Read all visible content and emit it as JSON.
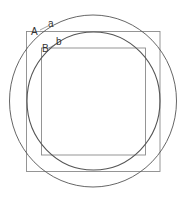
{
  "diagram": {
    "labels": {
      "outer_square": "A",
      "outer_circle": "a",
      "inner_square": "B",
      "inner_circle": "b"
    },
    "colors": {
      "square_stroke": "#8a8a8a",
      "circle_stroke": "#555555",
      "label": "#333333"
    }
  }
}
